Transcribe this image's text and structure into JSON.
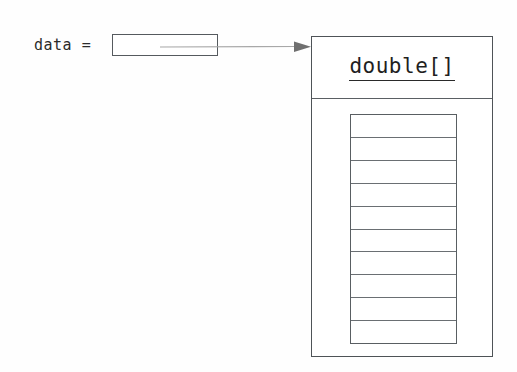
{
  "diagram": {
    "kind": "object-reference-diagram",
    "background_color": "#fefefe",
    "line_color": "#555a5e",
    "text_color": "#1f1f1f"
  },
  "variable": {
    "label": "data =",
    "reference_box_value": ""
  },
  "pointer": {
    "icon": "arrow-right-icon",
    "color": "#9a9a9a"
  },
  "object": {
    "type_name": "double[]",
    "type_name_underlined": true,
    "cells": [
      {
        "index": 0,
        "value": ""
      },
      {
        "index": 1,
        "value": ""
      },
      {
        "index": 2,
        "value": ""
      },
      {
        "index": 3,
        "value": ""
      },
      {
        "index": 4,
        "value": ""
      },
      {
        "index": 5,
        "value": ""
      },
      {
        "index": 6,
        "value": ""
      },
      {
        "index": 7,
        "value": ""
      },
      {
        "index": 8,
        "value": ""
      },
      {
        "index": 9,
        "value": ""
      }
    ]
  }
}
